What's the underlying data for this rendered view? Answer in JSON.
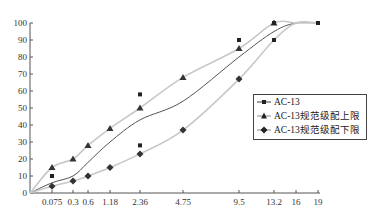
{
  "chart_data": {
    "type": "line",
    "title": "",
    "xlabel": "",
    "ylabel": "",
    "ylim": [
      0,
      100
    ],
    "yticks": [
      "0",
      "10",
      "20",
      "30",
      "40",
      "50",
      "60",
      "70",
      "80",
      "90",
      "100"
    ],
    "categories": [
      "0.075",
      "0.3",
      "0.6",
      "1.18",
      "2.36",
      "4.75",
      "9.5",
      "13.2",
      "16",
      "19"
    ],
    "series": [
      {
        "name": "AC-13",
        "marker": "square",
        "color": "#444444",
        "values": [
          6,
          10,
          18,
          30,
          43,
          54,
          80,
          95,
          100,
          100
        ],
        "markers": [
          {
            "x": "0.075",
            "y": 10
          },
          {
            "x": "2.36",
            "y": 58
          },
          {
            "x": "2.36",
            "y": 28
          },
          {
            "x": "9.5",
            "y": 90
          },
          {
            "x": "13.2",
            "y": 100
          },
          {
            "x": "13.2",
            "y": 90
          },
          {
            "x": "19",
            "y": 100
          }
        ]
      },
      {
        "name": "AC-13规范级配上限",
        "marker": "triangle",
        "color": "#aaaaaa",
        "values": [
          15,
          20,
          28,
          38,
          50,
          68,
          85,
          100,
          100,
          100
        ]
      },
      {
        "name": "AC-13规范级配下限",
        "marker": "diamond",
        "color": "#aaaaaa",
        "values": [
          4,
          7,
          10,
          15,
          23,
          37,
          67,
          90,
          100,
          100
        ]
      }
    ],
    "grid": false,
    "legend_position": "right-center"
  },
  "legend": {
    "items": [
      "AC-13",
      "AC-13规范级配上限",
      "AC-13规范级配下限"
    ]
  }
}
